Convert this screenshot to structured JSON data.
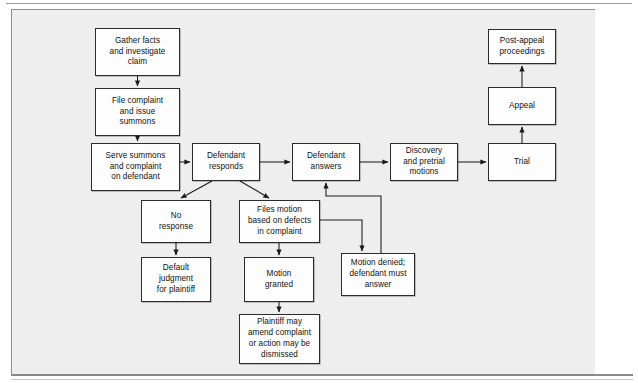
{
  "diagram": {
    "type": "flowchart",
    "background_color": "#eeeeee",
    "node_fill_color": "#fdfdfd",
    "node_border_color": "#2b2b2b",
    "edge_color": "#1a1a1a",
    "nodes": [
      {
        "id": "gather",
        "label": "Gather facts\nand investigate\nclaim",
        "x": 95,
        "y": 28,
        "w": 85,
        "h": 48
      },
      {
        "id": "file",
        "label": "File complaint\nand issue\nsummons",
        "x": 95,
        "y": 88,
        "w": 85,
        "h": 48
      },
      {
        "id": "serve",
        "label": "Serve summons\nand complaint\non defendant",
        "x": 91,
        "y": 143,
        "w": 89,
        "h": 48
      },
      {
        "id": "responds",
        "label": "Defendant\nresponds",
        "x": 192,
        "y": 143,
        "w": 68,
        "h": 38
      },
      {
        "id": "answers",
        "label": "Defendant\nanswers",
        "x": 292,
        "y": 143,
        "w": 68,
        "h": 38
      },
      {
        "id": "discovery",
        "label": "Discovery\nand pretrial\nmotions",
        "x": 390,
        "y": 143,
        "w": 68,
        "h": 38
      },
      {
        "id": "trial",
        "label": "Trial",
        "x": 488,
        "y": 143,
        "w": 68,
        "h": 38
      },
      {
        "id": "appeal",
        "label": "Appeal",
        "x": 488,
        "y": 87,
        "w": 68,
        "h": 38
      },
      {
        "id": "postappeal",
        "label": "Post-appeal\nproceedings",
        "x": 488,
        "y": 29,
        "w": 68,
        "h": 35
      },
      {
        "id": "noresponse",
        "label": "No\nresponse",
        "x": 141,
        "y": 200,
        "w": 70,
        "h": 43
      },
      {
        "id": "filesmotion",
        "label": "Files motion\nbased on defects\nin complaint",
        "x": 239,
        "y": 200,
        "w": 81,
        "h": 43
      },
      {
        "id": "default",
        "label": "Default\njudgment\nfor plaintiff",
        "x": 141,
        "y": 257,
        "w": 70,
        "h": 45
      },
      {
        "id": "granted",
        "label": "Motion\ngranted",
        "x": 244,
        "y": 257,
        "w": 70,
        "h": 45
      },
      {
        "id": "denied",
        "label": "Motion denied;\ndefendant must\nanswer",
        "x": 341,
        "y": 253,
        "w": 74,
        "h": 43
      },
      {
        "id": "amend",
        "label": "Plaintiff may\namend complaint\nor action may be\ndismissed",
        "x": 239,
        "y": 314,
        "w": 81,
        "h": 50
      }
    ],
    "edges": [
      {
        "id": "gather-to-file",
        "from": "gather",
        "to": "file",
        "style": "straight-down"
      },
      {
        "id": "file-to-serve",
        "from": "file",
        "to": "serve",
        "style": "straight-down"
      },
      {
        "id": "serve-to-responds",
        "from": "serve",
        "to": "responds",
        "style": "straight-right"
      },
      {
        "id": "responds-to-answers",
        "from": "responds",
        "to": "answers",
        "style": "straight-right"
      },
      {
        "id": "answers-to-discovery",
        "from": "answers",
        "to": "discovery",
        "style": "straight-right"
      },
      {
        "id": "discovery-to-trial",
        "from": "discovery",
        "to": "trial",
        "style": "straight-right"
      },
      {
        "id": "trial-to-appeal",
        "from": "trial",
        "to": "appeal",
        "style": "straight-up"
      },
      {
        "id": "appeal-to-postappeal",
        "from": "appeal",
        "to": "postappeal",
        "style": "straight-up"
      },
      {
        "id": "responds-to-noresponse",
        "from": "responds",
        "to": "noresponse",
        "style": "diagonal-down-left"
      },
      {
        "id": "responds-to-filesmotion",
        "from": "responds",
        "to": "filesmotion",
        "style": "diagonal-down-right"
      },
      {
        "id": "noresponse-to-default",
        "from": "noresponse",
        "to": "default",
        "style": "straight-down"
      },
      {
        "id": "filesmotion-to-granted",
        "from": "filesmotion",
        "to": "granted",
        "style": "straight-down"
      },
      {
        "id": "granted-to-amend",
        "from": "granted",
        "to": "amend",
        "style": "straight-down"
      },
      {
        "id": "filesmotion-to-denied",
        "from": "filesmotion",
        "to": "denied",
        "style": "orthogonal-right-down"
      },
      {
        "id": "denied-to-answers",
        "from": "denied",
        "to": "answers",
        "style": "orthogonal-up-left-up"
      }
    ]
  }
}
